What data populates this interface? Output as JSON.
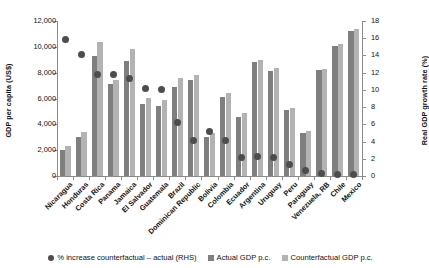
{
  "chart_data": {
    "type": "bar",
    "title": "",
    "xlabel": "",
    "ylabel": "GDP per capita (US$)",
    "ylabel_right": "Real GDP growth rate (%)",
    "ylim": [
      0,
      12000
    ],
    "ylim_right": [
      0,
      18
    ],
    "yticks": [
      "0",
      "2,000",
      "4,000",
      "6,000",
      "8,000",
      "10,000",
      "12,000"
    ],
    "yticks_right": [
      "0",
      "2",
      "4",
      "6",
      "8",
      "10",
      "12",
      "14",
      "16",
      "18"
    ],
    "grid": false,
    "legend_position": "bottom",
    "categories": [
      "Nicaragua",
      "Honduras",
      "Costa Rica",
      "Panama",
      "Jamaica",
      "El Salvador",
      "Guatemala",
      "Brazil",
      "Dominican Republic",
      "Bolivia",
      "Colombia",
      "Ecuador",
      "Argentina",
      "Uruguay",
      "Peru",
      "Paraguay",
      "Venezuela, RB",
      "Chile",
      "Mexico"
    ],
    "series": [
      {
        "name": "Actual GDP p.c.",
        "axis": "left",
        "color": "#7f7f7f",
        "values": [
          2000,
          3000,
          9300,
          7100,
          8900,
          5550,
          5450,
          6900,
          7400,
          3000,
          6150,
          4600,
          8800,
          8150,
          5100,
          3300,
          8200,
          10100,
          11200
        ]
      },
      {
        "name": "Counterfactual GDP p.c.",
        "axis": "left",
        "color": "#b3b3b3",
        "values": [
          2300,
          3400,
          10400,
          7400,
          9850,
          6050,
          5900,
          7550,
          7800,
          3300,
          6400,
          4900,
          9000,
          8350,
          5250,
          3450,
          8300,
          10250,
          11400
        ]
      },
      {
        "name": "% increase counterfactual – actual (RHS)",
        "axis": "right",
        "type": "scatter",
        "color": "#4d4d4d",
        "values": [
          15.8,
          14.1,
          11.8,
          11.8,
          11.3,
          10.2,
          10.0,
          6.2,
          4.1,
          5.2,
          4.1,
          2.2,
          2.3,
          2.1,
          1.3,
          0.6,
          0.3,
          0.2,
          0.2
        ]
      }
    ],
    "legend": [
      "% increase counterfactual – actual (RHS)",
      "Actual GDP p.c.",
      "Counterfactual GDP p.c."
    ]
  }
}
